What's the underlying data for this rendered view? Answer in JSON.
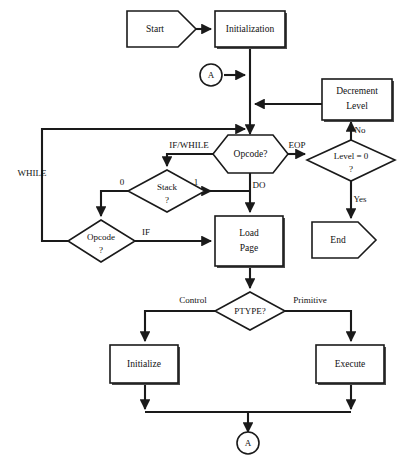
{
  "diagram": {
    "background_color": "#ffffff",
    "line_color": "#1a1a1a",
    "shadow_color": "#4a4a4a"
  },
  "nodes": {
    "start": {
      "label": "Start",
      "shape": "terminator"
    },
    "initialization": {
      "label": "Initialization",
      "shape": "process"
    },
    "connector_top": {
      "label": "A",
      "shape": "connector"
    },
    "decrement_level": {
      "label_line1": "Decrement",
      "label_line2": "Level",
      "shape": "process"
    },
    "opcode_main": {
      "label": "Opcode?",
      "shape": "hexagon"
    },
    "level_zero": {
      "label": "Level = 0",
      "question_mark": "?",
      "shape": "decision"
    },
    "stack": {
      "label": "Stack",
      "question_mark": "?",
      "shape": "decision"
    },
    "opcode_left": {
      "label": "Opcode",
      "question_mark": "?",
      "shape": "decision"
    },
    "load_page": {
      "label_line1": "Load",
      "label_line2": "Page",
      "shape": "process"
    },
    "end": {
      "label": "End",
      "shape": "terminator"
    },
    "ptype": {
      "label": "PTYPE?",
      "shape": "decision"
    },
    "initialize": {
      "label": "Initialize",
      "shape": "process"
    },
    "execute": {
      "label": "Execute",
      "shape": "process"
    },
    "connector_bottom": {
      "label": "A",
      "shape": "connector"
    }
  },
  "edge_labels": {
    "if_while": "IF/WHILE",
    "eop": "EOP",
    "no": "No",
    "yes": "Yes",
    "while": "WHILE",
    "stack_zero": "0",
    "stack_one": "1",
    "do": "DO",
    "if": "IF",
    "control": "Control",
    "primitive": "Primitive"
  }
}
